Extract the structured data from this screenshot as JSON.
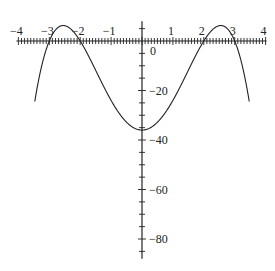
{
  "chart_data": {
    "type": "line",
    "title": "",
    "xlabel": "",
    "ylabel": "",
    "function": "y = -(x^2 - 4)(x^2 - 9)",
    "xlim": [
      -4,
      4
    ],
    "ylim": [
      -88,
      8
    ],
    "grid": false,
    "x_ticks": [
      -4,
      -3,
      -2,
      -1,
      1,
      2,
      3,
      4
    ],
    "x_tick_labels": [
      "−4",
      "−3",
      "−2",
      "−1",
      "1",
      "2",
      "3",
      "4"
    ],
    "y_ticks": [
      0,
      -20,
      -40,
      -60,
      -80
    ],
    "y_tick_labels": [
      "0",
      "−20",
      "−40",
      "−60",
      "−80"
    ],
    "series": [
      {
        "name": "f(x)",
        "color": "#222222",
        "x": [
          -3.45,
          -3.25,
          -3.0,
          -2.8,
          -2.55,
          -2.3,
          -2.0,
          -1.5,
          -1.0,
          -0.5,
          0.0,
          0.5,
          1.0,
          1.5,
          2.0,
          2.3,
          2.55,
          2.8,
          3.0,
          3.25,
          3.45
        ],
        "y": [
          -34.0,
          -14.5,
          0.0,
          5.3,
          6.2,
          3.9,
          0.0,
          -13.8,
          -24.0,
          -32.8,
          -36.0,
          -32.8,
          -24.0,
          -13.8,
          0.0,
          3.9,
          6.2,
          5.3,
          0.0,
          -14.5,
          -34.0
        ]
      }
    ],
    "roots": [
      -3,
      -2,
      2,
      3
    ],
    "local_maxima": [
      [
        -2.55,
        6.25
      ],
      [
        2.55,
        6.25
      ]
    ],
    "y_intercept": -36
  }
}
